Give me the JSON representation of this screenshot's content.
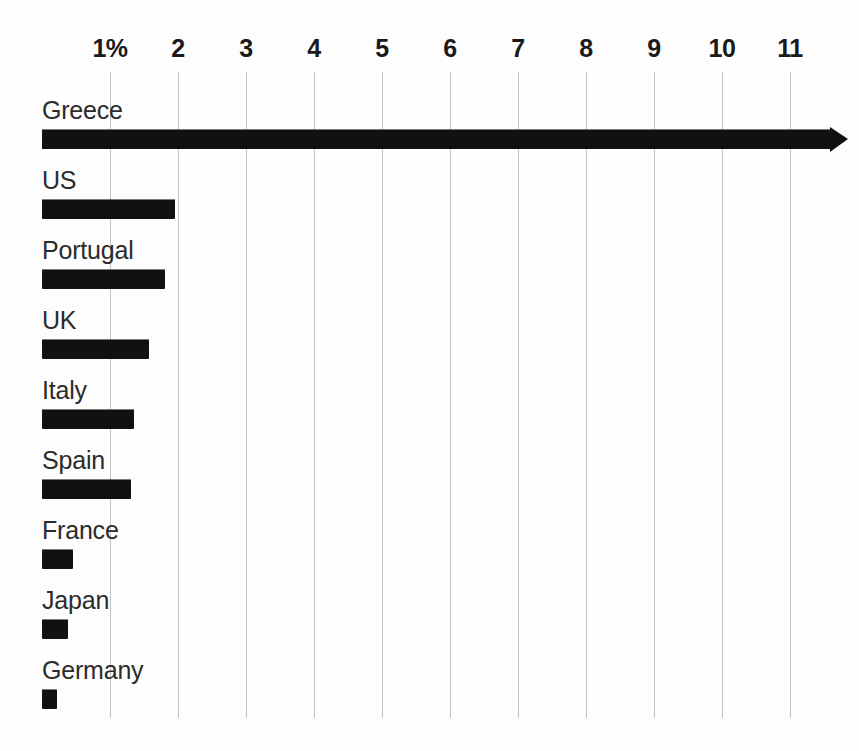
{
  "chart_data": {
    "type": "bar",
    "orientation": "horizontal",
    "title": "",
    "subtitle": "",
    "xlabel": "",
    "ylabel": "",
    "grid": true,
    "legend": null,
    "xlim": [
      0,
      11.8
    ],
    "categories": [
      "Greece",
      "US",
      "Portugal",
      "UK",
      "Italy",
      "Spain",
      "France",
      "Japan",
      "Germany"
    ],
    "values": [
      11.6,
      1.96,
      1.81,
      1.57,
      1.35,
      1.31,
      0.46,
      0.38,
      0.22
    ],
    "value_unit": "%",
    "tick_labels": [
      "1%",
      "2",
      "3",
      "4",
      "5",
      "6",
      "7",
      "8",
      "9",
      "10",
      "11"
    ],
    "tick_values": [
      1,
      2,
      3,
      4,
      5,
      6,
      7,
      8,
      9,
      10,
      11
    ],
    "bar_color": "#111111",
    "grid_color": "#b9b9b9",
    "background_color": "#fdfdfd"
  },
  "axis": {
    "ticks": [
      {
        "label": "1%",
        "value": 1
      },
      {
        "label": "2",
        "value": 2
      },
      {
        "label": "3",
        "value": 3
      },
      {
        "label": "4",
        "value": 4
      },
      {
        "label": "5",
        "value": 5
      },
      {
        "label": "6",
        "value": 6
      },
      {
        "label": "7",
        "value": 7
      },
      {
        "label": "8",
        "value": 8
      },
      {
        "label": "9",
        "value": 9
      },
      {
        "label": "10",
        "value": 10
      },
      {
        "label": "11",
        "value": 11
      }
    ]
  },
  "bars": [
    {
      "label": "Greece",
      "value": 11.6,
      "truncated": true
    },
    {
      "label": "US",
      "value": 1.96,
      "truncated": false
    },
    {
      "label": "Portugal",
      "value": 1.81,
      "truncated": false
    },
    {
      "label": "UK",
      "value": 1.57,
      "truncated": false
    },
    {
      "label": "Italy",
      "value": 1.35,
      "truncated": false
    },
    {
      "label": "Spain",
      "value": 1.31,
      "truncated": false
    },
    {
      "label": "France",
      "value": 0.46,
      "truncated": false
    },
    {
      "label": "Japan",
      "value": 0.38,
      "truncated": false
    },
    {
      "label": "Germany",
      "value": 0.22,
      "truncated": false
    }
  ],
  "caption": ""
}
